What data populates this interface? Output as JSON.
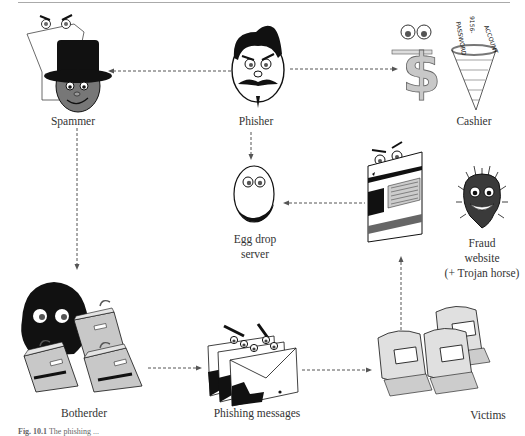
{
  "figure": {
    "caption_label": "Fig. 10.1",
    "caption_text": "The phishing ..."
  },
  "nodes": {
    "spammer": {
      "label": "Spammer"
    },
    "phisher": {
      "label": "Phisher"
    },
    "cashier": {
      "label": "Cashier"
    },
    "egg_drop": {
      "label_line1": "Egg drop",
      "label_line2": "server"
    },
    "fraud_website": {
      "label_line1": "Fraud",
      "label_line2": "website",
      "label_line3": "(+ Trojan horse)"
    },
    "botherder": {
      "label": "Botherder"
    },
    "phishing_messages": {
      "label": "Phishing messages"
    },
    "victims": {
      "label": "Victims"
    }
  },
  "net_text": {
    "line1": "PASSWORD",
    "line2": "9156-",
    "line3": "ACCOUNT"
  },
  "edges": [
    {
      "from": "phisher",
      "to": "spammer"
    },
    {
      "from": "phisher",
      "to": "cashier"
    },
    {
      "from": "phisher",
      "to": "egg_drop"
    },
    {
      "from": "spammer",
      "to": "botherder"
    },
    {
      "from": "botherder",
      "to": "phishing_messages"
    },
    {
      "from": "phishing_messages",
      "to": "victims"
    },
    {
      "from": "victims",
      "to": "fraud_website"
    },
    {
      "from": "fraud_website",
      "to": "egg_drop"
    }
  ],
  "colors": {
    "ink": "#111111",
    "gray_fill": "#c8c8c8",
    "dark_gray": "#6e6e6e",
    "arrow": "#555555"
  }
}
